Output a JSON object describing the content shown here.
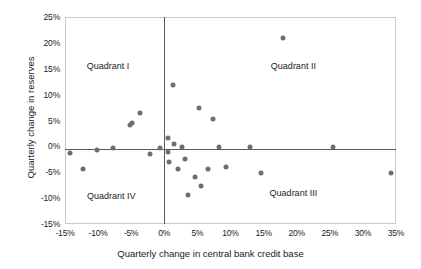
{
  "chart_data": {
    "type": "scatter",
    "title": "",
    "xlabel": "Quarterly change in central bank credit base",
    "ylabel": "Quarterly change in reserves",
    "xlim": [
      -15,
      35
    ],
    "ylim": [
      -15,
      25
    ],
    "xticks": [
      "-15%",
      "-10%",
      "-5%",
      "0%",
      "5%",
      "10%",
      "15%",
      "20%",
      "25%",
      "30%",
      "35%"
    ],
    "xtick_values": [
      -15,
      -10,
      -5,
      0,
      5,
      10,
      15,
      20,
      25,
      30,
      35
    ],
    "yticks": [
      "25%",
      "20%",
      "15%",
      "10%",
      "5%",
      "0%",
      "-5%",
      "-10%",
      "-15%"
    ],
    "ytick_values": [
      25,
      20,
      15,
      10,
      5,
      0,
      -5,
      -10,
      -15
    ],
    "grid": false,
    "legend": "none",
    "marker_color": "#6e6e6e",
    "axis_color": "#5a5a5a",
    "frame_color": "#c9c9c9",
    "annotations": [
      {
        "text": "Quadrant I",
        "x": -8.5,
        "y": 15.5
      },
      {
        "text": "Quadrant II",
        "x": 19.5,
        "y": 15.5
      },
      {
        "text": "Quadrant III",
        "x": 19.5,
        "y": -9.0
      },
      {
        "text": "Quadrant IV",
        "x": -8.0,
        "y": -9.5
      }
    ],
    "points": [
      {
        "x": -14.2,
        "y": -1.3
      },
      {
        "x": -12.3,
        "y": -4.3
      },
      {
        "x": -10.2,
        "y": -0.7
      },
      {
        "x": -7.7,
        "y": -0.3
      },
      {
        "x": -5.2,
        "y": 4.2
      },
      {
        "x": -4.9,
        "y": 4.6
      },
      {
        "x": -3.6,
        "y": 6.4
      },
      {
        "x": -2.2,
        "y": -1.5
      },
      {
        "x": -0.6,
        "y": -0.3
      },
      {
        "x": 0.6,
        "y": 1.6
      },
      {
        "x": 0.6,
        "y": -1.1
      },
      {
        "x": 0.7,
        "y": -3.0
      },
      {
        "x": 1.3,
        "y": 11.8
      },
      {
        "x": 1.5,
        "y": 0.4
      },
      {
        "x": 2.1,
        "y": -4.4
      },
      {
        "x": 2.6,
        "y": -0.2
      },
      {
        "x": 3.2,
        "y": -2.4
      },
      {
        "x": 3.6,
        "y": -9.3
      },
      {
        "x": 4.6,
        "y": -6.0
      },
      {
        "x": 5.2,
        "y": 7.4
      },
      {
        "x": 5.6,
        "y": -7.6
      },
      {
        "x": 6.6,
        "y": -4.3
      },
      {
        "x": 7.4,
        "y": 5.2
      },
      {
        "x": 8.2,
        "y": -0.1
      },
      {
        "x": 9.3,
        "y": -4.0
      },
      {
        "x": 13.0,
        "y": -0.2
      },
      {
        "x": 14.6,
        "y": -5.2
      },
      {
        "x": 17.9,
        "y": 21.0
      },
      {
        "x": 25.5,
        "y": -0.2
      },
      {
        "x": 34.3,
        "y": -5.1
      }
    ]
  }
}
